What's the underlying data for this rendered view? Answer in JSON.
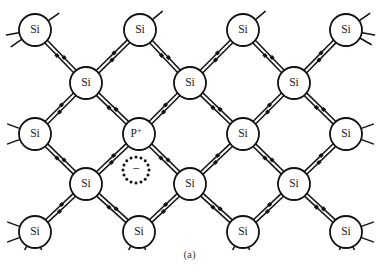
{
  "figure": {
    "caption": "(a)",
    "background_color": "#ffffff",
    "line_color": "#111111",
    "atom_fill_color": "#ffffff",
    "atom_stroke_color": "#111111",
    "bond_electron_color": "#111111"
  },
  "geometry": {
    "width": 379,
    "height": 277,
    "atom_radius": 16,
    "bond_gap": 3.6,
    "bond_dot_size": 3.6,
    "stub_length": 13,
    "electron_circle_radius": 13,
    "electron_dot_count": 16,
    "electron_dot_radius": 1.5
  },
  "atoms": [
    {
      "id": "a-r1-c1",
      "label": "Si",
      "charge": "",
      "x": 35,
      "y": 30,
      "row": 1,
      "col": 1
    },
    {
      "id": "a-r1-c2",
      "label": "Si",
      "charge": "",
      "x": 140,
      "y": 30,
      "row": 1,
      "col": 2
    },
    {
      "id": "a-r1-c3",
      "label": "Si",
      "charge": "",
      "x": 243,
      "y": 30,
      "row": 1,
      "col": 3
    },
    {
      "id": "a-r1-c4",
      "label": "Si",
      "charge": "",
      "x": 346,
      "y": 30,
      "row": 1,
      "col": 4
    },
    {
      "id": "a-r2-c1",
      "label": "Si",
      "charge": "",
      "x": 86,
      "y": 83,
      "row": 2,
      "col": 1
    },
    {
      "id": "a-r2-c2",
      "label": "Si",
      "charge": "",
      "x": 190,
      "y": 83,
      "row": 2,
      "col": 2
    },
    {
      "id": "a-r2-c3",
      "label": "Si",
      "charge": "",
      "x": 294,
      "y": 83,
      "row": 2,
      "col": 3
    },
    {
      "id": "a-r3-c1",
      "label": "Si",
      "charge": "",
      "x": 35,
      "y": 134,
      "row": 3,
      "col": 1
    },
    {
      "id": "a-r3-c2",
      "label": "P",
      "charge": "+",
      "x": 139,
      "y": 134,
      "row": 3,
      "col": 2
    },
    {
      "id": "a-r3-c3",
      "label": "Si",
      "charge": "",
      "x": 243,
      "y": 134,
      "row": 3,
      "col": 3
    },
    {
      "id": "a-r3-c4",
      "label": "Si",
      "charge": "",
      "x": 346,
      "y": 134,
      "row": 3,
      "col": 4
    },
    {
      "id": "a-r4-c1",
      "label": "Si",
      "charge": "",
      "x": 86,
      "y": 184,
      "row": 4,
      "col": 1
    },
    {
      "id": "a-r4-c2",
      "label": "Si",
      "charge": "",
      "x": 190,
      "y": 184,
      "row": 4,
      "col": 2
    },
    {
      "id": "a-r4-c3",
      "label": "Si",
      "charge": "",
      "x": 294,
      "y": 184,
      "row": 4,
      "col": 3
    },
    {
      "id": "a-r5-c1",
      "label": "Si",
      "charge": "",
      "x": 35,
      "y": 232,
      "row": 5,
      "col": 1
    },
    {
      "id": "a-r5-c2",
      "label": "Si",
      "charge": "",
      "x": 139,
      "y": 232,
      "row": 5,
      "col": 2
    },
    {
      "id": "a-r5-c3",
      "label": "Si",
      "charge": "",
      "x": 243,
      "y": 232,
      "row": 5,
      "col": 3
    },
    {
      "id": "a-r5-c4",
      "label": "Si",
      "charge": "",
      "x": 346,
      "y": 232,
      "row": 5,
      "col": 4
    }
  ],
  "bonds": [
    {
      "from": "a-r1-c1",
      "to": "a-r2-c1",
      "electrons": 2
    },
    {
      "from": "a-r1-c2",
      "to": "a-r2-c1",
      "electrons": 2
    },
    {
      "from": "a-r1-c2",
      "to": "a-r2-c2",
      "electrons": 2
    },
    {
      "from": "a-r1-c3",
      "to": "a-r2-c2",
      "electrons": 2
    },
    {
      "from": "a-r1-c3",
      "to": "a-r2-c3",
      "electrons": 2
    },
    {
      "from": "a-r1-c4",
      "to": "a-r2-c3",
      "electrons": 2
    },
    {
      "from": "a-r2-c1",
      "to": "a-r3-c1",
      "electrons": 2
    },
    {
      "from": "a-r2-c1",
      "to": "a-r3-c2",
      "electrons": 2
    },
    {
      "from": "a-r2-c2",
      "to": "a-r3-c2",
      "electrons": 2
    },
    {
      "from": "a-r2-c2",
      "to": "a-r3-c3",
      "electrons": 2
    },
    {
      "from": "a-r2-c3",
      "to": "a-r3-c3",
      "electrons": 2
    },
    {
      "from": "a-r2-c3",
      "to": "a-r3-c4",
      "electrons": 2
    },
    {
      "from": "a-r3-c1",
      "to": "a-r4-c1",
      "electrons": 2
    },
    {
      "from": "a-r3-c2",
      "to": "a-r4-c1",
      "electrons": 2
    },
    {
      "from": "a-r3-c2",
      "to": "a-r4-c2",
      "electrons": 2
    },
    {
      "from": "a-r3-c3",
      "to": "a-r4-c2",
      "electrons": 2
    },
    {
      "from": "a-r3-c3",
      "to": "a-r4-c3",
      "electrons": 2
    },
    {
      "from": "a-r3-c4",
      "to": "a-r4-c3",
      "electrons": 2
    },
    {
      "from": "a-r4-c1",
      "to": "a-r5-c1",
      "electrons": 2
    },
    {
      "from": "a-r4-c1",
      "to": "a-r5-c2",
      "electrons": 2
    },
    {
      "from": "a-r4-c2",
      "to": "a-r5-c2",
      "electrons": 2
    },
    {
      "from": "a-r4-c2",
      "to": "a-r5-c3",
      "electrons": 2
    },
    {
      "from": "a-r4-c3",
      "to": "a-r5-c3",
      "electrons": 2
    },
    {
      "from": "a-r4-c3",
      "to": "a-r5-c4",
      "electrons": 2
    }
  ],
  "stubs": [
    {
      "atom": "a-r1-c1",
      "angle": -35
    },
    {
      "atom": "a-r1-c1",
      "angle": 145
    },
    {
      "atom": "a-r1-c1",
      "angle": 170
    },
    {
      "atom": "a-r1-c2",
      "angle": -40
    },
    {
      "atom": "a-r1-c3",
      "angle": -40
    },
    {
      "atom": "a-r1-c4",
      "angle": -35
    },
    {
      "atom": "a-r1-c4",
      "angle": 30
    },
    {
      "atom": "a-r1-c4",
      "angle": 10
    },
    {
      "atom": "a-r3-c1",
      "angle": 160
    },
    {
      "atom": "a-r3-c1",
      "angle": 200
    },
    {
      "atom": "a-r3-c4",
      "angle": -20
    },
    {
      "atom": "a-r3-c4",
      "angle": 20
    },
    {
      "atom": "a-r5-c1",
      "angle": 160
    },
    {
      "atom": "a-r5-c1",
      "angle": 200
    },
    {
      "atom": "a-r5-c1",
      "angle": 120
    },
    {
      "atom": "a-r5-c1",
      "angle": 70
    },
    {
      "atom": "a-r5-c2",
      "angle": 120
    },
    {
      "atom": "a-r5-c2",
      "angle": 70
    },
    {
      "atom": "a-r5-c3",
      "angle": 120
    },
    {
      "atom": "a-r5-c3",
      "angle": 70
    },
    {
      "atom": "a-r5-c4",
      "angle": 20
    },
    {
      "atom": "a-r5-c4",
      "angle": -20
    },
    {
      "atom": "a-r5-c4",
      "angle": 110
    },
    {
      "atom": "a-r5-c4",
      "angle": 65
    }
  ],
  "free_electron": {
    "label": "−",
    "name": "free-electron",
    "x": 136,
    "y": 170,
    "description": "donor electron shown as dashed circle with minus sign"
  }
}
